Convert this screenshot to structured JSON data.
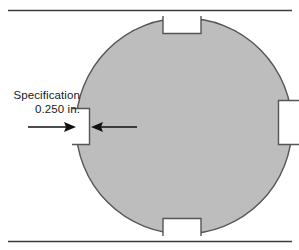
{
  "figure": {
    "type": "engineering-part-diagram",
    "background_color": "#ffffff",
    "width": 299,
    "height": 250
  },
  "rules": {
    "color": "#3c3c3c",
    "top": {
      "y": 10,
      "x_start": 8,
      "x_end": 292
    },
    "bottom": {
      "y": 241,
      "x_start": 8,
      "x_end": 292
    }
  },
  "disk": {
    "name": "circular-workpiece",
    "fill_color": "#bdbdbd",
    "stroke_color": "#555555",
    "center_x": 184,
    "center_y": 126,
    "radius": 108,
    "notch_count": 4
  },
  "notches": [
    {
      "position": "top",
      "name": "notch-top",
      "x": 163,
      "y": 18,
      "width": 38,
      "depth": 16
    },
    {
      "position": "left",
      "name": "notch-left",
      "x": 76,
      "y": 108,
      "width": 14,
      "depth": 37
    },
    {
      "position": "right",
      "name": "notch-right",
      "x": 278,
      "y": 100,
      "width": 21,
      "depth": 45
    },
    {
      "position": "bottom",
      "name": "notch-bottom",
      "x": 163,
      "y": 218,
      "width": 38,
      "depth": 16
    }
  ],
  "callout": {
    "name": "specification-callout",
    "line1": "Specification",
    "line2": "0.250 in.",
    "text_color": "#1a1a1a",
    "target": "notch-left"
  },
  "arrows": [
    {
      "name": "arrow-left-pointing-right",
      "direction": "right",
      "color": "#111111",
      "tail_x": 28,
      "tip_x": 76,
      "y": 127
    },
    {
      "name": "arrow-right-pointing-left",
      "direction": "left",
      "color": "#111111",
      "tail_x": 137,
      "tip_x": 91,
      "y": 127
    }
  ]
}
